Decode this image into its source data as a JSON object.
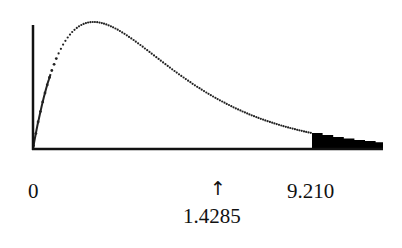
{
  "chart_data": {
    "type": "area",
    "title": "",
    "xlabel": "",
    "ylabel": "",
    "x_ticks": [
      "0",
      "9.210"
    ],
    "critical_value": 9.21,
    "test_statistic": 1.4285,
    "annotations": [
      {
        "text": "↑",
        "at": 1.4285
      },
      {
        "text": "1.4285",
        "at": 1.4285
      }
    ],
    "shaded_region": {
      "from": 9.21,
      "to": "right tail"
    },
    "curve_style": "dotted",
    "grid": false,
    "legend": false
  },
  "labels": {
    "zero": "0",
    "critical": "9.210",
    "arrow": "↑",
    "statistic": "1.4285"
  },
  "colors": {
    "curve": "#222222",
    "axis": "#111111",
    "shade": "#000000"
  }
}
